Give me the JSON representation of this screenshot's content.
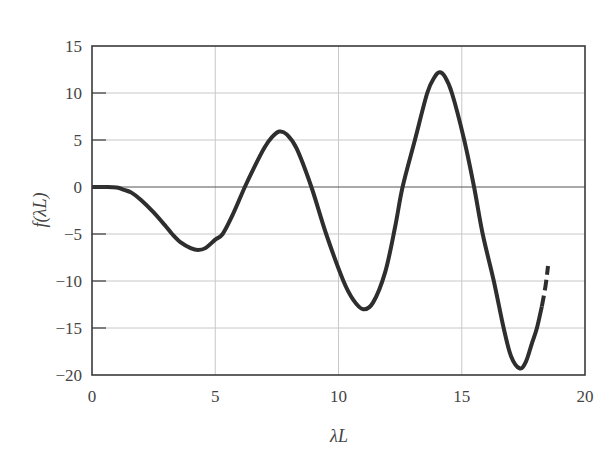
{
  "chart_data": {
    "type": "line",
    "title": "",
    "xlabel": "λL",
    "ylabel": "f(λL)",
    "xlim": [
      0,
      20
    ],
    "ylim": [
      -20,
      15
    ],
    "xticks": [
      0,
      5,
      10,
      15,
      20
    ],
    "yticks": [
      15,
      10,
      5,
      0,
      -5,
      -10,
      -15,
      -20
    ],
    "xtick_labels": [
      "0",
      "5",
      "10",
      "15",
      "20"
    ],
    "ytick_labels": [
      "15",
      "10",
      "5",
      "0",
      "−5",
      "−10",
      "−15",
      "−20"
    ],
    "grid": true,
    "legend": null,
    "colors": {
      "curve": "#2e2e2e",
      "grid": "#c8c8c8",
      "axis": "#3a3a3a",
      "zero_line": "#555555"
    },
    "series": [
      {
        "name": "f(λL)",
        "style": "solid",
        "x": [
          0,
          0.5,
          1.0,
          1.3,
          1.6,
          2.0,
          2.5,
          3.0,
          3.25,
          3.6,
          4.0,
          4.3,
          4.6,
          5.0,
          5.3,
          5.7,
          6.2,
          6.6,
          7.0,
          7.3,
          7.6,
          7.9,
          8.3,
          8.9,
          9.5,
          10.2,
          10.6,
          11.0,
          11.4,
          11.9,
          12.3,
          12.6,
          13.1,
          13.6,
          13.9,
          14.1,
          14.3,
          14.6,
          15.1,
          15.5,
          15.85,
          16.3,
          16.7,
          17.0,
          17.35,
          17.6,
          17.85,
          18.05,
          18.25
        ],
        "y": [
          0,
          0,
          -0.05,
          -0.3,
          -0.6,
          -1.4,
          -2.7,
          -4.2,
          -5.0,
          -5.9,
          -6.5,
          -6.7,
          -6.5,
          -5.6,
          -5.0,
          -3.0,
          0,
          2.2,
          4.2,
          5.3,
          5.9,
          5.6,
          4.1,
          0,
          -5.0,
          -10.0,
          -12.0,
          -13.0,
          -12.3,
          -9.0,
          -4.2,
          0,
          5.0,
          10.0,
          11.7,
          12.2,
          11.8,
          10.0,
          5.0,
          0,
          -5.0,
          -10.0,
          -15.0,
          -18.0,
          -19.3,
          -18.6,
          -16.6,
          -15.0,
          -12.7
        ]
      },
      {
        "name": "f(λL) extrapolated",
        "style": "dashed",
        "x": [
          18.25,
          18.4,
          18.5
        ],
        "y": [
          -12.7,
          -10.5,
          -8.4
        ]
      }
    ]
  }
}
